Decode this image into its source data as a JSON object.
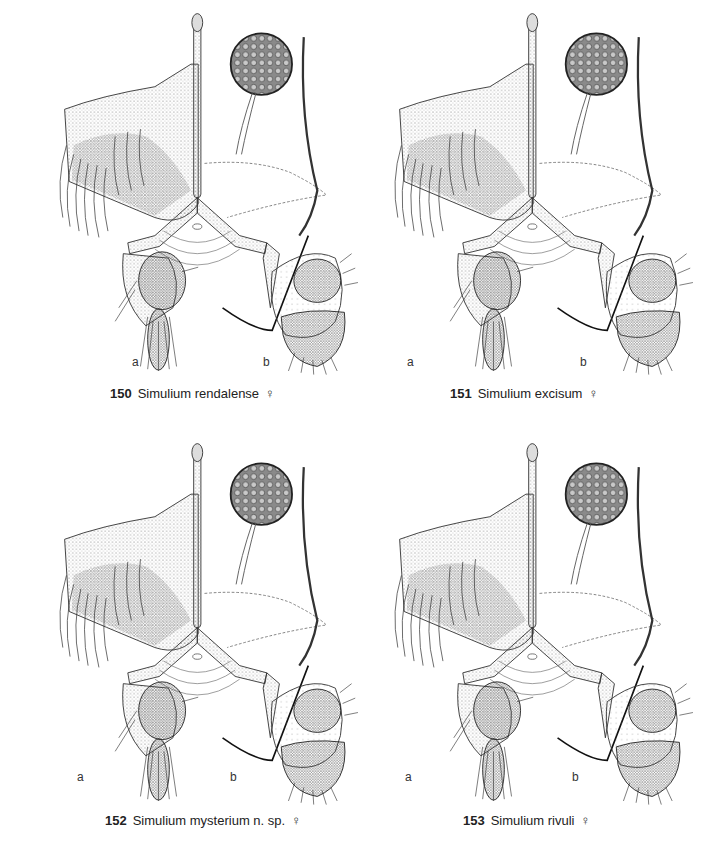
{
  "figures": [
    {
      "number": "150",
      "species": "Simulium rendalense",
      "sex_symbol": "♀",
      "subpanels": [
        "a",
        "b"
      ]
    },
    {
      "number": "151",
      "species": "Simulium excisum",
      "sex_symbol": "♀",
      "subpanels": [
        "a",
        "b"
      ]
    },
    {
      "number": "152",
      "species": "Simulium mysterium n. sp.",
      "sex_symbol": "♀",
      "subpanels": [
        "a",
        "b"
      ]
    },
    {
      "number": "153",
      "species": "Simulium rivuli",
      "sex_symbol": "♀",
      "subpanels": [
        "a",
        "b"
      ]
    }
  ]
}
